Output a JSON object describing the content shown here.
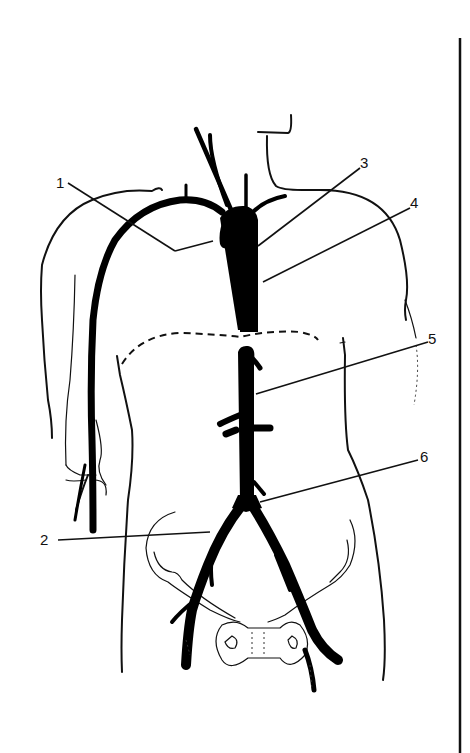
{
  "figure": {
    "type": "anatomical line drawing",
    "colors": {
      "ink": "#000000",
      "background": "#ffffff"
    }
  },
  "labels": [
    {
      "id": "1",
      "text": "1",
      "x": 58,
      "y": 186,
      "points_to": "subclavian artery branch / arch vessel (right side of figure)"
    },
    {
      "id": "2",
      "text": "2",
      "x": 40,
      "y": 540,
      "points_to": "left common iliac artery region near bifurcation"
    },
    {
      "id": "3",
      "text": "3",
      "x": 362,
      "y": 166,
      "points_to": "left subclavian artery origin"
    },
    {
      "id": "4",
      "text": "4",
      "x": 412,
      "y": 206,
      "points_to": "descending thoracic aorta"
    },
    {
      "id": "5",
      "text": "5",
      "x": 430,
      "y": 340,
      "points_to": "abdominal aorta below diaphragm"
    },
    {
      "id": "6",
      "text": "6",
      "x": 422,
      "y": 457,
      "points_to": "lower abdominal aorta near bifurcation"
    }
  ]
}
